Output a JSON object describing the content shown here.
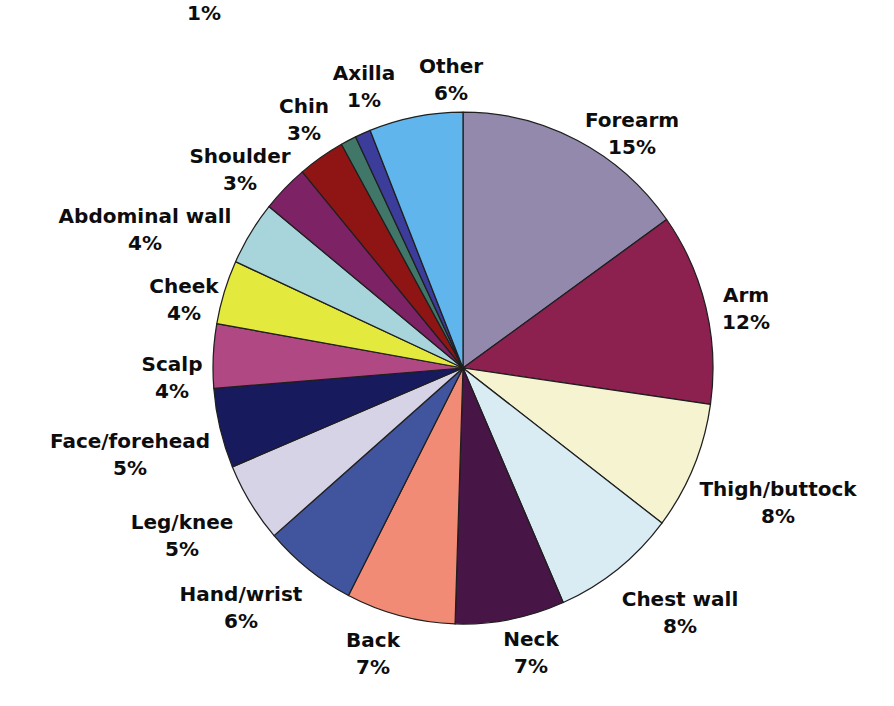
{
  "chart_data": {
    "type": "pie",
    "title": "",
    "direction": "clockwise",
    "start_angle_deg_from_12": 0,
    "total_shown_pct": 99,
    "stroke_color": "#1f1f1f",
    "background_color": "#ffffff",
    "layout": {
      "cx": 463,
      "cy": 368,
      "rx": 250,
      "ry": 256
    },
    "slices": [
      {
        "label": "Forearm",
        "value_pct": 15,
        "pct_label": "15%",
        "color": "#9289AC",
        "label_pos": {
          "x": 632,
          "y": 107
        }
      },
      {
        "label": "Arm",
        "value_pct": 12,
        "pct_label": "12%",
        "color": "#8C2150",
        "label_pos": {
          "x": 746,
          "y": 282
        }
      },
      {
        "label": "Thigh/buttock",
        "value_pct": 8,
        "pct_label": "8%",
        "color": "#F5F3D0",
        "label_pos": {
          "x": 778,
          "y": 476
        }
      },
      {
        "label": "Chest wall",
        "value_pct": 8,
        "pct_label": "8%",
        "color": "#D9EBF3",
        "label_pos": {
          "x": 680,
          "y": 586
        }
      },
      {
        "label": "Neck",
        "value_pct": 7,
        "pct_label": "7%",
        "color": "#471546",
        "label_pos": {
          "x": 531,
          "y": 626
        }
      },
      {
        "label": "Back",
        "value_pct": 7,
        "pct_label": "7%",
        "color": "#F28B76",
        "label_pos": {
          "x": 373,
          "y": 627
        }
      },
      {
        "label": "Hand/wrist",
        "value_pct": 6,
        "pct_label": "6%",
        "color": "#41549E",
        "label_pos": {
          "x": 241,
          "y": 581
        }
      },
      {
        "label": "Leg/knee",
        "value_pct": 5,
        "pct_label": "5%",
        "color": "#D7D3E7",
        "label_pos": {
          "x": 182,
          "y": 509
        }
      },
      {
        "label": "Face/forehead",
        "value_pct": 5,
        "pct_label": "5%",
        "color": "#171A5C",
        "label_pos": {
          "x": 130,
          "y": 428
        }
      },
      {
        "label": "Scalp",
        "value_pct": 4,
        "pct_label": "4%",
        "color": "#B04883",
        "label_pos": {
          "x": 172,
          "y": 351
        }
      },
      {
        "label": "Cheek",
        "value_pct": 4,
        "pct_label": "4%",
        "color": "#E4E93E",
        "label_pos": {
          "x": 184,
          "y": 273
        }
      },
      {
        "label": "Abdominal wall",
        "value_pct": 4,
        "pct_label": "4%",
        "color": "#A8D4DB",
        "label_pos": {
          "x": 145,
          "y": 203
        }
      },
      {
        "label": "Shoulder",
        "value_pct": 3,
        "pct_label": "3%",
        "color": "#7D2264",
        "label_pos": {
          "x": 240,
          "y": 143
        }
      },
      {
        "label": "Chin",
        "value_pct": 3,
        "pct_label": "3%",
        "color": "#8F1515",
        "label_pos": {
          "x": 304,
          "y": 93
        }
      },
      {
        "label": "Axilla",
        "value_pct": 1,
        "pct_label": "1%",
        "color": "#417768",
        "label_pos": {
          "x": 364,
          "y": 60
        }
      },
      {
        "label": "",
        "value_pct": 1,
        "pct_label": "1%",
        "color": "#3C3C9A",
        "label_pos": {
          "x": 204,
          "y": 0
        },
        "label_name_truncated_by_image_edge": true
      },
      {
        "label": "Other",
        "value_pct": 6,
        "pct_label": "6%",
        "color": "#60B6EC",
        "label_pos": {
          "x": 451,
          "y": 53
        }
      }
    ]
  }
}
